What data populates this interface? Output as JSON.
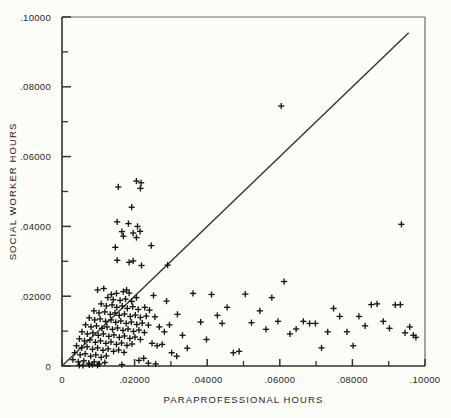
{
  "chart_data": {
    "type": "scatter",
    "title": "",
    "xlabel": "PARAPROFESSIONAL HOURS",
    "ylabel": "SOCIAL WORKER HOURS",
    "xlim": [
      0,
      0.1
    ],
    "ylim": [
      0,
      0.1
    ],
    "grid": false,
    "legend": null,
    "xticklabels": [
      "0",
      ".02000",
      ".04000",
      ".06000",
      ".08000",
      ".10000"
    ],
    "xtickvalues": [
      0,
      0.02,
      0.04,
      0.06,
      0.08,
      0.1
    ],
    "yticklabels": [
      "0",
      ".02000",
      ".04000",
      ".06000",
      ".08000",
      ".10000"
    ],
    "ytickvalues": [
      0,
      0.02,
      0.04,
      0.06,
      0.08,
      0.1
    ],
    "minor_tick_interval": 0.01,
    "marker": "plus",
    "marker_color": "#16150f",
    "reference_line": {
      "name": "identity-line",
      "from": [
        0,
        0
      ],
      "to": [
        0.0955,
        0.0955
      ],
      "color": "#3a3833"
    },
    "points": [
      [
        0.0155,
        0.0513
      ],
      [
        0.0205,
        0.053
      ],
      [
        0.0218,
        0.0525
      ],
      [
        0.0216,
        0.0509
      ],
      [
        0.0192,
        0.0455
      ],
      [
        0.0152,
        0.0413
      ],
      [
        0.0183,
        0.0408
      ],
      [
        0.0208,
        0.04
      ],
      [
        0.0165,
        0.0385
      ],
      [
        0.0196,
        0.0381
      ],
      [
        0.0215,
        0.0386
      ],
      [
        0.0169,
        0.0372
      ],
      [
        0.0205,
        0.0368
      ],
      [
        0.0147,
        0.034
      ],
      [
        0.0246,
        0.0345
      ],
      [
        0.0152,
        0.0303
      ],
      [
        0.0185,
        0.0297
      ],
      [
        0.0196,
        0.0301
      ],
      [
        0.0219,
        0.0288
      ],
      [
        0.0291,
        0.0289
      ],
      [
        0.0604,
        0.0745
      ],
      [
        0.0935,
        0.0406
      ],
      [
        0.0098,
        0.0218
      ],
      [
        0.0115,
        0.0222
      ],
      [
        0.0136,
        0.0205
      ],
      [
        0.015,
        0.0208
      ],
      [
        0.0169,
        0.0213
      ],
      [
        0.0178,
        0.0218
      ],
      [
        0.0185,
        0.0209
      ],
      [
        0.0126,
        0.0196
      ],
      [
        0.0141,
        0.019
      ],
      [
        0.016,
        0.0188
      ],
      [
        0.0175,
        0.0192
      ],
      [
        0.0192,
        0.0185
      ],
      [
        0.0205,
        0.0196
      ],
      [
        0.0108,
        0.0178
      ],
      [
        0.0122,
        0.0172
      ],
      [
        0.0138,
        0.0175
      ],
      [
        0.0151,
        0.0168
      ],
      [
        0.0166,
        0.0172
      ],
      [
        0.018,
        0.0165
      ],
      [
        0.0195,
        0.017
      ],
      [
        0.021,
        0.0162
      ],
      [
        0.0228,
        0.0168
      ],
      [
        0.0241,
        0.016
      ],
      [
        0.0088,
        0.0158
      ],
      [
        0.0102,
        0.0152
      ],
      [
        0.0118,
        0.0155
      ],
      [
        0.0133,
        0.0148
      ],
      [
        0.0146,
        0.0152
      ],
      [
        0.0158,
        0.0145
      ],
      [
        0.0172,
        0.0149
      ],
      [
        0.0188,
        0.0142
      ],
      [
        0.0202,
        0.0146
      ],
      [
        0.0216,
        0.0139
      ],
      [
        0.0232,
        0.0143
      ],
      [
        0.0075,
        0.0138
      ],
      [
        0.009,
        0.0132
      ],
      [
        0.0105,
        0.0135
      ],
      [
        0.012,
        0.0128
      ],
      [
        0.0135,
        0.0132
      ],
      [
        0.0148,
        0.0125
      ],
      [
        0.0162,
        0.0129
      ],
      [
        0.0177,
        0.0122
      ],
      [
        0.0191,
        0.0126
      ],
      [
        0.0206,
        0.0119
      ],
      [
        0.0221,
        0.0123
      ],
      [
        0.0238,
        0.0117
      ],
      [
        0.0065,
        0.0118
      ],
      [
        0.008,
        0.0112
      ],
      [
        0.0095,
        0.0115
      ],
      [
        0.011,
        0.0108
      ],
      [
        0.0124,
        0.0112
      ],
      [
        0.0139,
        0.0105
      ],
      [
        0.0153,
        0.0109
      ],
      [
        0.0168,
        0.0102
      ],
      [
        0.0182,
        0.0106
      ],
      [
        0.0197,
        0.0099
      ],
      [
        0.0212,
        0.0103
      ],
      [
        0.0227,
        0.0096
      ],
      [
        0.0055,
        0.0098
      ],
      [
        0.007,
        0.0092
      ],
      [
        0.0085,
        0.0095
      ],
      [
        0.01,
        0.0088
      ],
      [
        0.0114,
        0.0092
      ],
      [
        0.0129,
        0.0085
      ],
      [
        0.0143,
        0.0089
      ],
      [
        0.0158,
        0.0082
      ],
      [
        0.0172,
        0.0086
      ],
      [
        0.0187,
        0.0079
      ],
      [
        0.0201,
        0.0083
      ],
      [
        0.0216,
        0.0076
      ],
      [
        0.0048,
        0.0078
      ],
      [
        0.0062,
        0.0072
      ],
      [
        0.0077,
        0.0075
      ],
      [
        0.0092,
        0.0068
      ],
      [
        0.0106,
        0.0072
      ],
      [
        0.0121,
        0.0065
      ],
      [
        0.0135,
        0.0069
      ],
      [
        0.015,
        0.0062
      ],
      [
        0.0164,
        0.0066
      ],
      [
        0.0179,
        0.0059
      ],
      [
        0.0193,
        0.0063
      ],
      [
        0.004,
        0.0058
      ],
      [
        0.0054,
        0.0052
      ],
      [
        0.0069,
        0.0055
      ],
      [
        0.0084,
        0.0048
      ],
      [
        0.0098,
        0.0052
      ],
      [
        0.0113,
        0.0045
      ],
      [
        0.0127,
        0.0049
      ],
      [
        0.0142,
        0.0042
      ],
      [
        0.0156,
        0.0046
      ],
      [
        0.0171,
        0.0039
      ],
      [
        0.0035,
        0.0038
      ],
      [
        0.005,
        0.0032
      ],
      [
        0.0064,
        0.0035
      ],
      [
        0.0079,
        0.0028
      ],
      [
        0.0093,
        0.0032
      ],
      [
        0.0108,
        0.0025
      ],
      [
        0.0122,
        0.0029
      ],
      [
        0.003,
        0.0018
      ],
      [
        0.0045,
        0.0012
      ],
      [
        0.006,
        0.0015
      ],
      [
        0.0074,
        0.0008
      ],
      [
        0.0089,
        0.0012
      ],
      [
        0.0103,
        0.0006
      ],
      [
        0.0118,
        0.001
      ],
      [
        0.0048,
        0.0002
      ],
      [
        0.0058,
        0.0002
      ],
      [
        0.0075,
        0.0003
      ],
      [
        0.0084,
        0.0004
      ],
      [
        0.0098,
        0.0002
      ],
      [
        0.0165,
        0.0004
      ],
      [
        0.0212,
        0.0016
      ],
      [
        0.0256,
        0.0141
      ],
      [
        0.0268,
        0.0112
      ],
      [
        0.0282,
        0.0098
      ],
      [
        0.0296,
        0.0118
      ],
      [
        0.0248,
        0.0065
      ],
      [
        0.0262,
        0.0058
      ],
      [
        0.0276,
        0.0062
      ],
      [
        0.0318,
        0.0148
      ],
      [
        0.0332,
        0.0088
      ],
      [
        0.0345,
        0.0051
      ],
      [
        0.0361,
        0.0208
      ],
      [
        0.0382,
        0.0126
      ],
      [
        0.0398,
        0.0076
      ],
      [
        0.0412,
        0.0205
      ],
      [
        0.0428,
        0.0145
      ],
      [
        0.0441,
        0.0122
      ],
      [
        0.0455,
        0.0168
      ],
      [
        0.0472,
        0.0038
      ],
      [
        0.0488,
        0.0042
      ],
      [
        0.0505,
        0.0206
      ],
      [
        0.0522,
        0.0124
      ],
      [
        0.0545,
        0.0158
      ],
      [
        0.0562,
        0.0105
      ],
      [
        0.0578,
        0.0196
      ],
      [
        0.0595,
        0.0128
      ],
      [
        0.0612,
        0.0242
      ],
      [
        0.0628,
        0.0092
      ],
      [
        0.0645,
        0.0106
      ],
      [
        0.0665,
        0.0128
      ],
      [
        0.0682,
        0.0122
      ],
      [
        0.0698,
        0.0122
      ],
      [
        0.0715,
        0.0052
      ],
      [
        0.0732,
        0.0098
      ],
      [
        0.0748,
        0.0165
      ],
      [
        0.0765,
        0.0142
      ],
      [
        0.0785,
        0.0098
      ],
      [
        0.0802,
        0.0058
      ],
      [
        0.0818,
        0.0142
      ],
      [
        0.0835,
        0.0115
      ],
      [
        0.0852,
        0.0176
      ],
      [
        0.0868,
        0.0178
      ],
      [
        0.0885,
        0.0128
      ],
      [
        0.0902,
        0.0108
      ],
      [
        0.0918,
        0.0175
      ],
      [
        0.0932,
        0.0176
      ],
      [
        0.0945,
        0.0095
      ],
      [
        0.0958,
        0.0112
      ],
      [
        0.0968,
        0.0088
      ],
      [
        0.0975,
        0.0082
      ],
      [
        0.0252,
        0.0202
      ],
      [
        0.0288,
        0.0186
      ],
      [
        0.0302,
        0.0038
      ],
      [
        0.0316,
        0.0028
      ],
      [
        0.0225,
        0.0022
      ],
      [
        0.0238,
        0.0008
      ],
      [
        0.0258,
        0.0006
      ]
    ]
  }
}
